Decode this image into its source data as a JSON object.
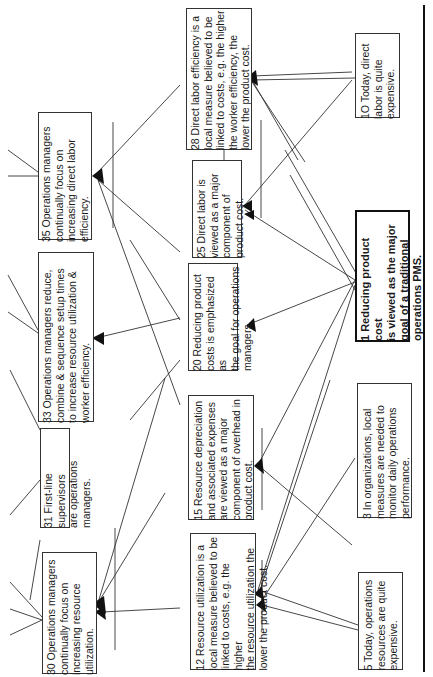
{
  "diagram": {
    "orientation": "rotated-90-ccw",
    "nodes": [
      {
        "id": "35",
        "text": "35 Operations managers\ncontinually focus on\nincreasing direct labor\nefficiency."
      },
      {
        "id": "33",
        "text": "33 Operations managers reduce,\ncombine & sequence setup times\nto increase resource utilization &\nworker efficiency."
      },
      {
        "id": "31",
        "text": "31 First-line supervisors\nare operations managers."
      },
      {
        "id": "30",
        "text": "30 Operations managers\ncontinually focus on\nincreasing resource\nutilization."
      },
      {
        "id": "28",
        "text": "28 Direct labor efficiency is a\nlocal measure believed to be\nlinked to costs, e.g. the higher\nthe worker efficiency, the\nlower the product cost."
      },
      {
        "id": "25",
        "text": "25 Direct labor is\nviewed as a major\ncomponent of\nproduct cost."
      },
      {
        "id": "20",
        "text": "20 Reducing product\ncosts is emphasized as\nthe  goal for operations\nmanagers."
      },
      {
        "id": "15",
        "text": "15 Resource depreciation\nand associated expenses\nare viewed as a major\ncomponent of overhead in\nproduct cost."
      },
      {
        "id": "12",
        "text": "12 Resource utilization is a\nlocal measure believed to be\nlinked to costs, e.g. the higher\nthe resource utilization the\nlower the product cost."
      },
      {
        "id": "10",
        "text": "1O Today, direct\nlabor is quite\nexpensive."
      },
      {
        "id": "1",
        "text": "1 Reducing product cost\nis viewed as the major\ngoal of a traditional\noperations PMS."
      },
      {
        "id": "3",
        "text": "3 In organizations, local\nmeasures are needed  to\nmonitor daily operations\nperformance."
      },
      {
        "id": "5",
        "text": "5 Today, operations\nresources are quite\nexpensive."
      }
    ],
    "colors": {
      "line": "#333333",
      "border": "#333333",
      "rule": "#111111"
    }
  }
}
